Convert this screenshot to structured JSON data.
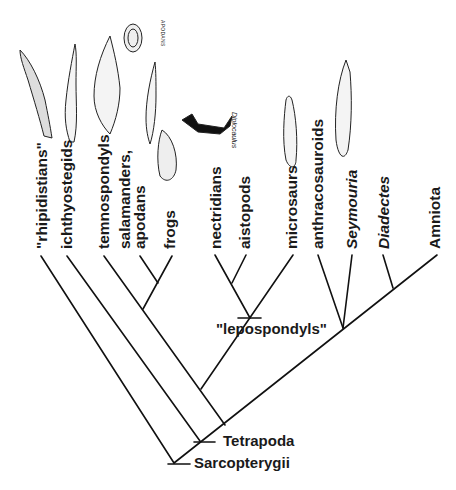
{
  "taxa": [
    {
      "label": "\"rhipidistians\"",
      "italic": false
    },
    {
      "label": "ichthyostegids",
      "italic": false
    },
    {
      "label": "temnospondyls",
      "italic": false
    },
    {
      "label": "salamanders,",
      "italic": false
    },
    {
      "label": "apodans",
      "italic": false
    },
    {
      "label": "frogs",
      "italic": false
    },
    {
      "label": "nectridians",
      "italic": false
    },
    {
      "label": "aistopods",
      "italic": false
    },
    {
      "label": "microsaurs",
      "italic": false
    },
    {
      "label": "anthracosauroids",
      "italic": false
    },
    {
      "label": "Seymouria",
      "italic": true
    },
    {
      "label": "Diadectes",
      "italic": true
    },
    {
      "label": "Amniota",
      "italic": false
    }
  ],
  "nodes": {
    "lepospondyls": "\"lepospondyls\"",
    "tetrapoda": "Tetrapoda",
    "sarcopterygii": "Sarcopterygii"
  },
  "illustration_labels": {
    "apodans": "APODANS",
    "diplocaulus": "Diplocaulus"
  },
  "colors": {
    "line": "#111111",
    "text": "#1a1a1a",
    "background": "#ffffff"
  }
}
